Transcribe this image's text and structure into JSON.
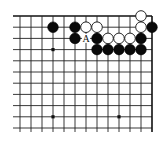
{
  "diagram": {
    "type": "go-board-corner",
    "corner": "top-right",
    "visible_columns": 13,
    "visible_rows": 11,
    "origin_x": 20,
    "origin_y": 16,
    "spacing_x": 11,
    "spacing_y": 11.2,
    "edges": {
      "top": true,
      "right": true,
      "left": false,
      "bottom": false
    },
    "star_points": [
      [
        3,
        3
      ],
      [
        9,
        3
      ],
      [
        3,
        9
      ],
      [
        9,
        9
      ]
    ],
    "stones": {
      "black": [
        [
          3,
          1
        ],
        [
          5,
          1
        ],
        [
          5,
          2
        ],
        [
          7,
          2
        ],
        [
          11,
          2
        ],
        [
          12,
          1
        ],
        [
          7,
          3
        ],
        [
          8,
          3
        ],
        [
          9,
          3
        ],
        [
          10,
          3
        ],
        [
          11,
          3
        ]
      ],
      "white": [
        [
          6,
          1
        ],
        [
          7,
          1
        ],
        [
          11,
          0
        ],
        [
          11,
          1
        ],
        [
          8,
          2
        ],
        [
          9,
          2
        ],
        [
          10,
          2
        ]
      ]
    },
    "labels": [
      {
        "text": "A",
        "col": 6,
        "row": 2
      }
    ],
    "colors": {
      "black_stone": "#0a0a0a",
      "white_stone": "#ffffff",
      "grid": "#222222",
      "background": "#ffffff"
    }
  }
}
